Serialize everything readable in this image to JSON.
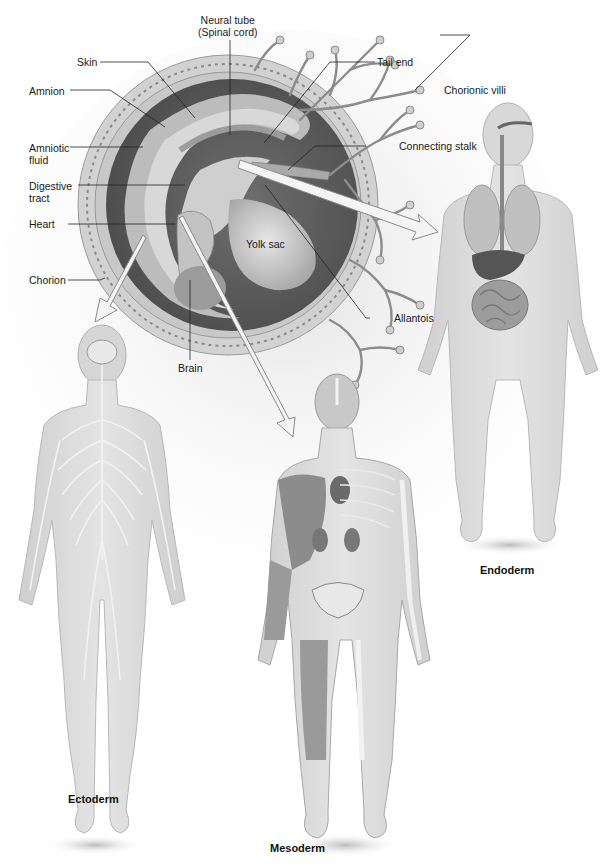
{
  "diagram": {
    "type": "embryo-germ-layer-anatomy",
    "embryo_labels": {
      "neural_tube": [
        "Neural tube",
        "(Spinal cord)"
      ],
      "skin": "Skin",
      "tail_end": "Tail end",
      "chorionic_villi": "Chorionic villi",
      "amnion": "Amnion",
      "amniotic_fluid": [
        "Amniotic",
        "fluid"
      ],
      "connecting_stalk": "Connecting stalk",
      "digestive_tract": [
        "Digestive",
        "tract"
      ],
      "heart": "Heart",
      "yolk_sac": "Yolk sac",
      "chorion": "Chorion",
      "allantois": "Allantois",
      "brain": "Brain"
    },
    "germ_layers": [
      {
        "name": "Ectoderm",
        "system": "nervous-system",
        "figure": "left"
      },
      {
        "name": "Mesoderm",
        "system": "muscle-skeletal-kidney-heart",
        "figure": "center"
      },
      {
        "name": "Endoderm",
        "system": "digestive-respiratory",
        "figure": "right"
      }
    ],
    "colors": {
      "background": "#ffffff",
      "amniotic_dark": "#5a5a5a",
      "embryo_light": "#bdbdbd",
      "body_skin": "#d9d9d9",
      "arrow_fill": "#f4f4f4",
      "text": "#1a1a1a"
    }
  }
}
